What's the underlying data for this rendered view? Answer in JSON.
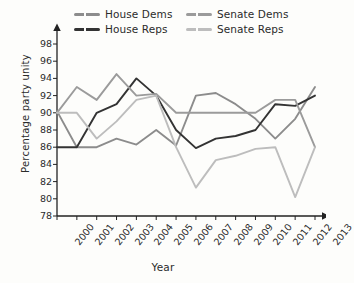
{
  "chart_data": {
    "type": "line",
    "title": "",
    "xlabel": "Year",
    "ylabel": "Percentage party unity",
    "grid": false,
    "legend_position": "top",
    "xlim": [
      2000,
      2013
    ],
    "ylim": [
      78,
      98
    ],
    "x": [
      2000,
      2001,
      2002,
      2003,
      2004,
      2005,
      2006,
      2007,
      2008,
      2009,
      2010,
      2011,
      2012,
      2013
    ],
    "xticks": [
      "2000",
      "2001",
      "2002",
      "2003",
      "2004",
      "2005",
      "2006",
      "2007",
      "2008",
      "2009",
      "2010",
      "2011",
      "2012",
      "2013"
    ],
    "yticks": [
      "98",
      "96",
      "94",
      "92",
      "90",
      "88",
      "86",
      "84",
      "82",
      "80",
      "78"
    ],
    "series": [
      {
        "name": "House Dems",
        "color": "#8c8c8c",
        "values": [
          90.2,
          86.0,
          86.0,
          87.0,
          86.3,
          88.0,
          86.2,
          92.0,
          92.3,
          91.0,
          89.3,
          87.0,
          89.3,
          93.0
        ]
      },
      {
        "name": "House Reps",
        "color": "#333333",
        "values": [
          86.0,
          86.0,
          90.0,
          91.0,
          94.0,
          92.0,
          88.0,
          85.9,
          87.0,
          87.3,
          88.0,
          91.0,
          90.8,
          92.0
        ]
      },
      {
        "name": "Senate Dems",
        "color": "#9b9b9b",
        "values": [
          90.0,
          93.0,
          91.5,
          94.5,
          92.0,
          92.2,
          90.0,
          90.0,
          90.0,
          90.0,
          90.0,
          91.5,
          91.5,
          86.0
        ]
      },
      {
        "name": "Senate Reps",
        "color": "#bdbdbd",
        "values": [
          90.0,
          90.0,
          87.0,
          89.0,
          91.5,
          92.0,
          86.0,
          81.3,
          84.5,
          85.0,
          85.8,
          86.0,
          80.2,
          86.0
        ]
      }
    ]
  },
  "legend": {
    "items": [
      {
        "label": "House Dems"
      },
      {
        "label": "Senate Dems"
      },
      {
        "label": "House Reps"
      },
      {
        "label": "Senate Reps"
      }
    ]
  },
  "axes": {
    "y_title": "Percentage party unity",
    "x_title": "Year"
  }
}
